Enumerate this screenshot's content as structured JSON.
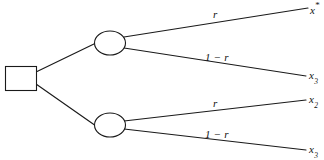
{
  "diagram": {
    "type": "decision-tree",
    "title": "",
    "background_color": "#ffffff",
    "line_color": "#1a1a1a",
    "nodes": {
      "decision": {
        "shape": "square",
        "label": ""
      },
      "chance_upper": {
        "shape": "circle",
        "label": ""
      },
      "chance_lower": {
        "shape": "circle",
        "label": ""
      }
    },
    "branch_labels": {
      "upper_top": "r",
      "upper_bottom": "1 − r",
      "lower_top": "r",
      "lower_bottom": "1 − r"
    },
    "outcomes": [
      {
        "base": "x",
        "sup": "*",
        "sub": ""
      },
      {
        "base": "x",
        "sup": "",
        "sub": "3"
      },
      {
        "base": "x",
        "sup": "",
        "sub": "2"
      },
      {
        "base": "x",
        "sup": "",
        "sub": "3"
      }
    ]
  }
}
